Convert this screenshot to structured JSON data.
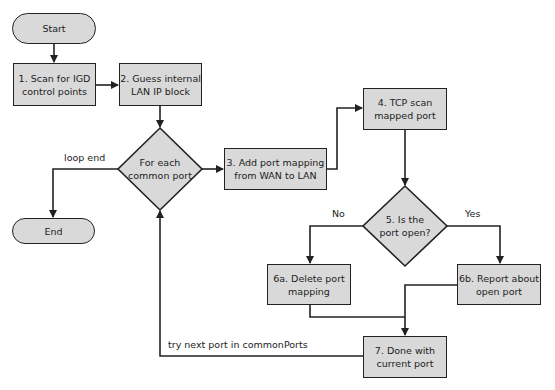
{
  "diagram": {
    "nodes": {
      "start": {
        "label": "Start",
        "shape": "terminal"
      },
      "end": {
        "label": "End",
        "shape": "terminal"
      },
      "step1": {
        "lines": [
          "1. Scan for IGD",
          "control points"
        ],
        "shape": "process"
      },
      "step2": {
        "lines": [
          "2. Guess internal",
          "LAN IP block"
        ],
        "shape": "process"
      },
      "loop": {
        "lines": [
          "For each",
          "common port"
        ],
        "shape": "decision"
      },
      "step3": {
        "lines": [
          "3. Add port mapping",
          "from WAN to LAN"
        ],
        "shape": "process"
      },
      "step4": {
        "lines": [
          "4. TCP scan",
          "mapped port"
        ],
        "shape": "process"
      },
      "step5": {
        "lines": [
          "5. Is the",
          "port open?"
        ],
        "shape": "decision"
      },
      "step6a": {
        "lines": [
          "6a. Delete port",
          "mapping"
        ],
        "shape": "process"
      },
      "step6b": {
        "lines": [
          "6b. Report about",
          "open port"
        ],
        "shape": "process"
      },
      "step7": {
        "lines": [
          "7. Done with",
          "current port"
        ],
        "shape": "process"
      }
    },
    "edge_labels": {
      "loop_end": "loop end",
      "no": "No",
      "yes": "Yes",
      "try_next": "try next port in commonPorts"
    },
    "colors": {
      "fill": "#d9d9d9",
      "stroke": "#222222",
      "background": "#ffffff"
    }
  }
}
